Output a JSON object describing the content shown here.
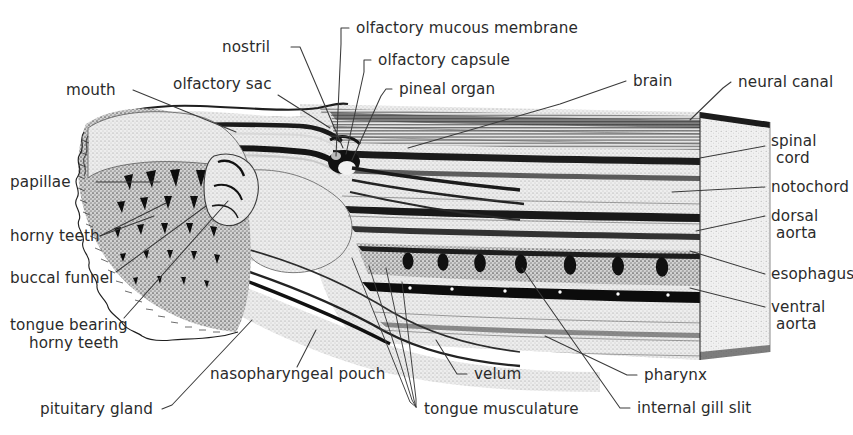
{
  "figure": {
    "background_color": "#ffffff",
    "ink_color": "#2b2b2b",
    "leader_color": "#3a3a3a",
    "width": 853,
    "height": 435
  },
  "labels": {
    "mouth": "mouth",
    "olfactory_sac": "olfactory sac",
    "nostril": "nostril",
    "olfactory_mucous_membrane": "olfactory mucous membrane",
    "olfactory_capsule": "olfactory capsule",
    "pineal_organ": "pineal organ",
    "brain": "brain",
    "neural_canal": "neural canal",
    "spinal_cord_1": "spinal",
    "spinal_cord_2": "cord",
    "notochord": "notochord",
    "dorsal_aorta_1": "dorsal",
    "dorsal_aorta_2": "aorta",
    "esophagus": "esophagus",
    "ventral_aorta_1": "ventral",
    "ventral_aorta_2": "aorta",
    "papillae": "papillae",
    "horny_teeth": "horny teeth",
    "buccal_funnel": "buccal funnel",
    "tongue_bearing_1": "tongue bearing",
    "tongue_bearing_2": "horny teeth",
    "pituitary_gland": "pituitary gland",
    "nasopharyngeal_pouch": "nasopharyngeal pouch",
    "tongue_musculature": "tongue musculature",
    "velum": "velum",
    "pharynx": "pharynx",
    "internal_gill_slit": "internal gill slit"
  },
  "structures": {
    "gill_slit_count": 7,
    "teeth_rows": 5,
    "body_bands": 9
  }
}
